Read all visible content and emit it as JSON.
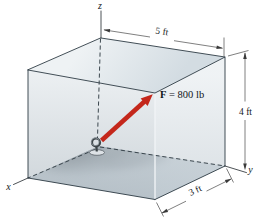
{
  "figure": {
    "type": "statics-3d-box-force-diagram",
    "force": {
      "symbol": "F",
      "equals_value": " = 800 lb"
    },
    "dims": {
      "top": "5 ft",
      "right": "4 ft",
      "bottom": "3 ft"
    },
    "axes": {
      "x": "x",
      "y": "y",
      "z": "z"
    },
    "colors": {
      "arrow_red": "#c4271b",
      "edge": "#2e3b44",
      "face_top_light": "#eef2f4",
      "face_top_dark": "#d3dce2",
      "face_left_light": "#dfe5e9",
      "face_left_dark": "#aeb9c1",
      "face_right_light": "#e2e8ec",
      "face_right_dark": "#b9c4cc",
      "floor": "#c6cfd6",
      "shadow": "#4e575e",
      "background": "#ffffff",
      "text": "#14181b"
    }
  }
}
